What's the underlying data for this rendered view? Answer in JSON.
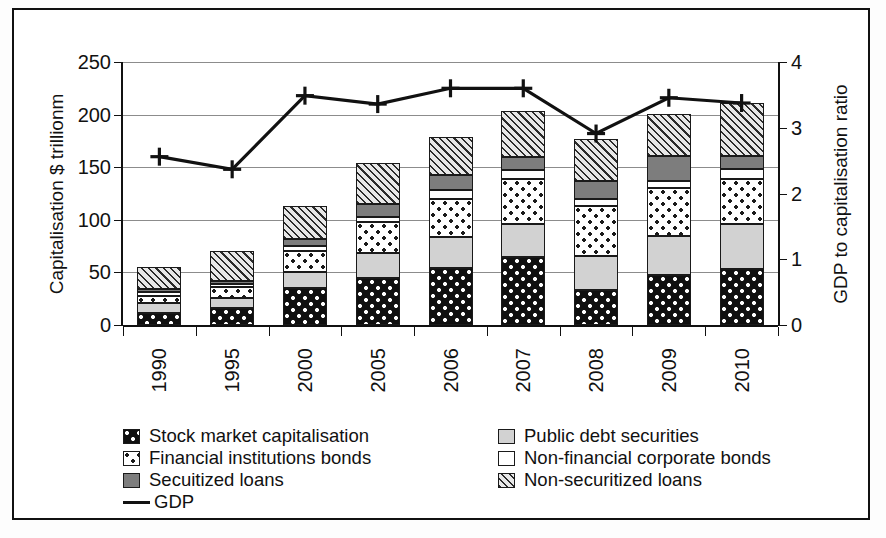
{
  "chart_data": {
    "type": "bar",
    "subtype": "stacked-bar-with-line-overlay",
    "title": "",
    "xlabel": "",
    "ylabel": "Capitalisation $ trillionm",
    "y2label": "GDP to capitalisation ratio",
    "categories": [
      "1990",
      "1995",
      "2000",
      "2005",
      "2006",
      "2007",
      "2008",
      "2009",
      "2010"
    ],
    "ylim": [
      0,
      250
    ],
    "y2lim": [
      0,
      4
    ],
    "yticks": [
      "0",
      "50",
      "100",
      "150",
      "200",
      "250"
    ],
    "y2ticks": [
      "0",
      "1",
      "2",
      "3",
      "4"
    ],
    "grid": true,
    "legend_position": "bottom",
    "series": [
      {
        "name": "Stock market capitalisation",
        "pattern": "black-with-white-dots",
        "values": [
          11,
          16,
          35,
          45,
          54,
          65,
          33,
          48,
          53
        ]
      },
      {
        "name": "Public debt securities",
        "pattern": "light-grey-solid",
        "values": [
          10,
          10,
          15,
          23,
          30,
          31,
          33,
          37,
          43
        ]
      },
      {
        "name": "Financial institutions bonds",
        "pattern": "white-with-black-dots",
        "values": [
          7,
          10,
          20,
          30,
          36,
          43,
          47,
          45,
          43
        ]
      },
      {
        "name": "Non-financial corporate bonds",
        "pattern": "white-solid",
        "values": [
          3,
          3,
          5,
          5,
          8,
          8,
          7,
          7,
          9
        ]
      },
      {
        "name": "Secuitized loans",
        "pattern": "dark-grey-solid",
        "values": [
          3,
          3,
          7,
          12,
          15,
          13,
          17,
          24,
          13
        ]
      },
      {
        "name": "Non-securitized loans",
        "pattern": "diagonal-hatch",
        "values": [
          21,
          28,
          31,
          39,
          36,
          43,
          40,
          40,
          50
        ]
      }
    ],
    "line_series": {
      "name": "GDP",
      "axis": "right",
      "marker": "plus",
      "values_left_scale": [
        160,
        148,
        218,
        210,
        225,
        225,
        182,
        216,
        211
      ],
      "values_ratio": [
        2.56,
        2.37,
        3.49,
        3.36,
        3.6,
        3.6,
        2.91,
        3.46,
        3.38
      ]
    },
    "totals": [
      55,
      70,
      113,
      154,
      179,
      203,
      177,
      201,
      211
    ]
  },
  "legend": {
    "left": [
      {
        "label": "Stock market capitalisation",
        "swatch": "p-stock"
      },
      {
        "label": "Financial institutions bonds",
        "swatch": "p-finbonds"
      },
      {
        "label": "Secuitized loans",
        "swatch": "p-secur"
      },
      {
        "label": "GDP",
        "swatch": "line"
      }
    ],
    "right": [
      {
        "label": "Public debt securities",
        "swatch": "p-public"
      },
      {
        "label": "Non-financial corporate bonds",
        "swatch": "p-nonfin"
      },
      {
        "label": "Non-securitized loans",
        "swatch": "p-nonsecur"
      }
    ]
  },
  "colors": {
    "stock": "#101010",
    "public_debt": "#d2d2d2",
    "financial_bonds": "#ffffff",
    "non_financial_bonds": "#ffffff",
    "secuitized": "#7d7d7d",
    "non_secuitized": "#e8e8e8",
    "gdp_line": "#111111",
    "grid": "#8c8c8c",
    "axis": "#111111"
  }
}
